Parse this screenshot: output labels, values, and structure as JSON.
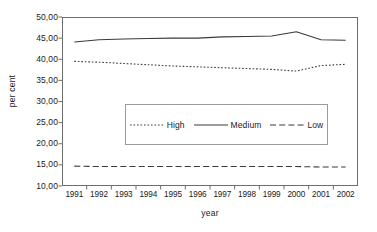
{
  "chart_data": {
    "type": "line",
    "title": "",
    "xlabel": "year",
    "ylabel": "per cent",
    "x": [
      1991,
      1992,
      1993,
      1994,
      1995,
      1996,
      1997,
      1998,
      1999,
      2000,
      2001,
      2002
    ],
    "xtick_labels": [
      "1991",
      "1992",
      "1993",
      "1994",
      "1995",
      "1996",
      "1997",
      "1998",
      "1999",
      "2000",
      "2001",
      "2002"
    ],
    "ytick_labels": [
      "50,00",
      "45,00",
      "40,00",
      "35,00",
      "30,00",
      "25,00",
      "20,00",
      "15,00",
      "10,00"
    ],
    "ytick_values": [
      50,
      45,
      40,
      35,
      30,
      25,
      20,
      15,
      10
    ],
    "ylim": [
      10,
      50
    ],
    "grid": false,
    "legend_position": "center",
    "series": [
      {
        "name": "High",
        "style": "dotted",
        "color": "#3a3a3a",
        "values": [
          39.5,
          39.3,
          39.0,
          38.7,
          38.4,
          38.2,
          38.0,
          37.8,
          37.6,
          37.2,
          38.5,
          38.8
        ]
      },
      {
        "name": "Medium",
        "style": "solid",
        "color": "#3a3a3a",
        "values": [
          44.1,
          44.6,
          44.8,
          44.9,
          45.0,
          45.0,
          45.3,
          45.4,
          45.5,
          46.5,
          44.6,
          44.5
        ]
      },
      {
        "name": "Low",
        "style": "dashed",
        "color": "#3a3a3a",
        "values": [
          14.7,
          14.6,
          14.6,
          14.6,
          14.6,
          14.6,
          14.6,
          14.6,
          14.6,
          14.6,
          14.5,
          14.5
        ]
      }
    ]
  }
}
